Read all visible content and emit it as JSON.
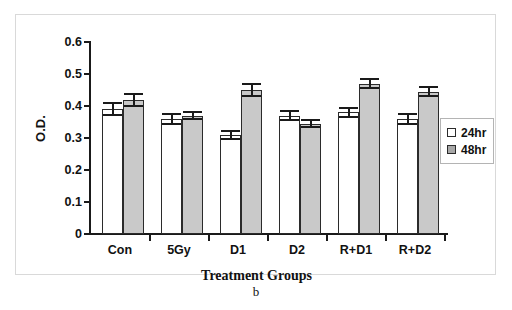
{
  "figure": {
    "caption": "b"
  },
  "legend": {
    "position": "right",
    "items": [
      {
        "label": "24hr",
        "swatch": "open-square-icon",
        "color": "#ffffff"
      },
      {
        "label": "48hr",
        "swatch": "filled-square-icon",
        "color": "#c9c9c9"
      }
    ]
  },
  "axes": {
    "y_title": "O.D.",
    "x_title": "Treatment Groups",
    "y_ticks": [
      "0.6",
      "0.5",
      "0.4",
      "0.3",
      "0.2",
      "0.1",
      "0"
    ]
  },
  "chart_data": {
    "type": "bar",
    "title": "",
    "subtitle": "",
    "xlabel": "Treatment Groups",
    "ylabel": "O.D.",
    "ylim": [
      0,
      0.6
    ],
    "ytick_values": [
      0,
      0.1,
      0.2,
      0.3,
      0.4,
      0.5,
      0.6
    ],
    "grid": false,
    "legend_position": "right",
    "categories": [
      "Con",
      "5Gy",
      "D1",
      "D2",
      "R+D1",
      "R+D2"
    ],
    "series": [
      {
        "name": "24hr",
        "color": "#ffffff",
        "values": [
          0.39,
          0.36,
          0.31,
          0.37,
          0.38,
          0.36
        ],
        "errors": [
          0.022,
          0.018,
          0.015,
          0.018,
          0.016,
          0.018
        ]
      },
      {
        "name": "48hr",
        "color": "#c9c9c9",
        "values": [
          0.42,
          0.37,
          0.45,
          0.345,
          0.47,
          0.445
        ],
        "errors": [
          0.022,
          0.015,
          0.022,
          0.015,
          0.018,
          0.018
        ]
      }
    ],
    "annotations": [
      "b"
    ]
  }
}
